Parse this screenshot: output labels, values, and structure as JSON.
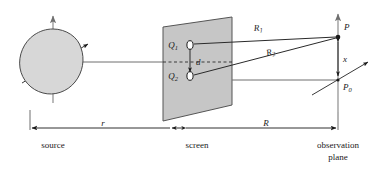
{
  "figure": {
    "type": "optics-double-slit-geometry",
    "background": "#ffffff",
    "ink": "#1a1a1a",
    "screen_fill": "#c6c6c6",
    "source_fill": "#d7d7d7",
    "slit_fill": "#ffffff",
    "axis_gray": "#8d8d8d"
  },
  "labels": {
    "source": "source",
    "screen": "screen",
    "observation_line1": "observation",
    "observation_line2": "plane",
    "slit1": "Q",
    "slit1_sub": "1",
    "slit2": "Q",
    "slit2_sub": "2",
    "slit_separation": "d",
    "ray1": "R",
    "ray1_sub": "1",
    "ray2": "R",
    "ray2_sub": "2",
    "point_p": "P",
    "point_p0": "P",
    "point_p0_sub": "0",
    "height_x": "x",
    "dim_r": "r",
    "dim_R": "R"
  },
  "geometry": {
    "source_center_x": 53,
    "source_center_y": 62,
    "screen_x": 190,
    "slit1_y": 45,
    "slit2_y": 76,
    "observation_x": 338,
    "point_p_y": 36,
    "point_p0_y": 80,
    "axis_y": 62
  }
}
